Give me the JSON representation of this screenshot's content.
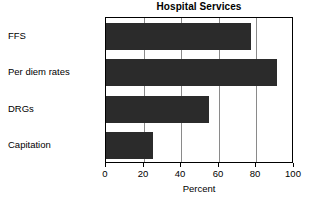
{
  "chart_data": {
    "type": "bar",
    "orientation": "horizontal",
    "title": "Hospital Services",
    "xlabel": "Percent",
    "ylabel": "",
    "categories": [
      "FFS",
      "Per diem rates",
      "DRGs",
      "Capitation"
    ],
    "values": [
      77,
      91,
      55,
      25
    ],
    "xlim": [
      0,
      100
    ],
    "xticks": [
      0,
      20,
      40,
      60,
      80,
      100
    ],
    "xtick_labels": [
      "0",
      "20",
      "40",
      "60",
      "80",
      "100"
    ],
    "grid": true,
    "grid_axis": "x",
    "legend": false,
    "bar_color": "#2b2b2b",
    "frame_color": "#000000",
    "grid_color": "#8a8a8a",
    "background": "#ffffff"
  }
}
